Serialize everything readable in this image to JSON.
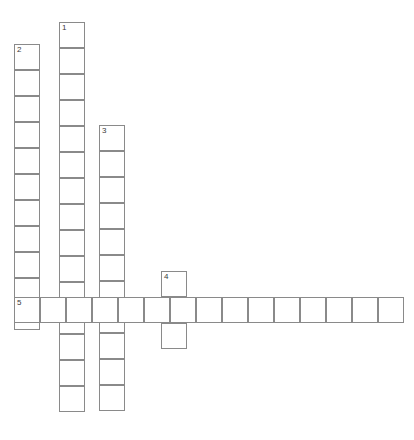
{
  "puzzle": {
    "title": "Crossword Puzzle Grid",
    "type": "crossword-grid",
    "canvas": {
      "width": 414,
      "height": 440
    },
    "style": {
      "cell_size": 26,
      "cell_fill": "#ffffff",
      "cell_border": "#8a8a8a",
      "border_width": 1,
      "number_color": "#3a3a3a",
      "number_font_size": 8,
      "background": "#ffffff"
    },
    "entries": [
      {
        "number": "1",
        "direction": "down",
        "length": 15,
        "start": {
          "x": 59,
          "y": 22
        },
        "label": "1-down"
      },
      {
        "number": "2",
        "direction": "down",
        "length": 11,
        "start": {
          "x": 14,
          "y": 44
        },
        "label": "2-down"
      },
      {
        "number": "3",
        "direction": "down",
        "length": 11,
        "start": {
          "x": 99,
          "y": 125
        },
        "label": "3-down"
      },
      {
        "number": "4",
        "direction": "down",
        "length": 3,
        "start": {
          "x": 161,
          "y": 271
        },
        "label": "4-down"
      },
      {
        "number": "5",
        "direction": "across",
        "length": 15,
        "start": {
          "x": 14,
          "y": 297
        },
        "label": "5-across"
      }
    ],
    "numbered_cells": [
      {
        "number": "1",
        "x": 59,
        "y": 22
      },
      {
        "number": "2",
        "x": 14,
        "y": 44
      },
      {
        "number": "3",
        "x": 99,
        "y": 125
      },
      {
        "number": "4",
        "x": 161,
        "y": 271
      },
      {
        "number": "5",
        "x": 14,
        "y": 297
      }
    ]
  }
}
